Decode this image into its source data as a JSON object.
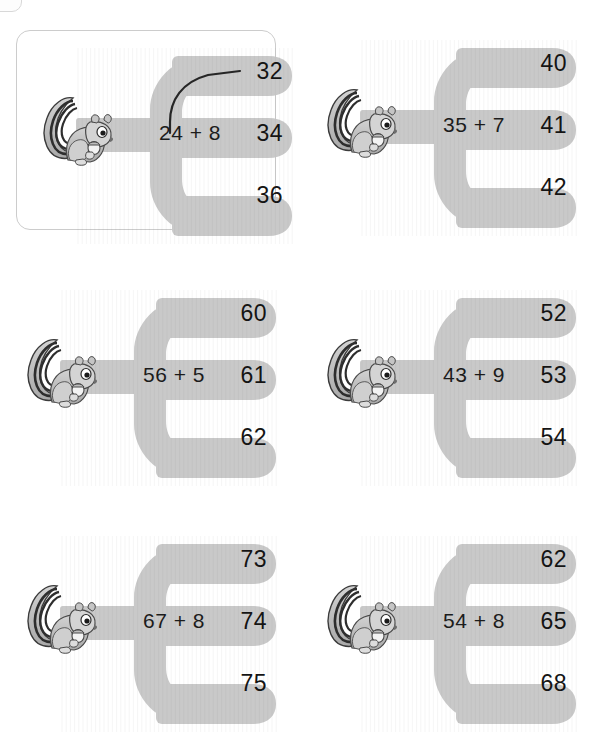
{
  "worksheet": {
    "title": "Addition with regrouping - choose the correct sum",
    "background_color": "#ffffff",
    "piece_color": "#c9c9c9",
    "text_color": "#141414",
    "frame_color": "#cccccc",
    "icon_name": "squirrel-icon"
  },
  "problems": [
    {
      "id": "problem-1",
      "is_example": true,
      "equation": "24 + 8",
      "left_operand": "24",
      "operator": "+",
      "right_operand": "8",
      "options": [
        "32",
        "34",
        "36"
      ],
      "answer": "32",
      "answer_index": 0,
      "answer_drawn": true
    },
    {
      "id": "problem-2",
      "is_example": false,
      "equation": "35 + 7",
      "left_operand": "35",
      "operator": "+",
      "right_operand": "7",
      "options": [
        "40",
        "41",
        "42"
      ],
      "answer": "42",
      "answer_index": 2,
      "answer_drawn": false
    },
    {
      "id": "problem-3",
      "is_example": false,
      "equation": "56 + 5",
      "left_operand": "56",
      "operator": "+",
      "right_operand": "5",
      "options": [
        "60",
        "61",
        "62"
      ],
      "answer": "61",
      "answer_index": 1,
      "answer_drawn": false
    },
    {
      "id": "problem-4",
      "is_example": false,
      "equation": "43 + 9",
      "left_operand": "43",
      "operator": "+",
      "right_operand": "9",
      "options": [
        "52",
        "53",
        "54"
      ],
      "answer": "52",
      "answer_index": 0,
      "answer_drawn": false
    },
    {
      "id": "problem-5",
      "is_example": false,
      "equation": "67 + 8",
      "left_operand": "67",
      "operator": "+",
      "right_operand": "8",
      "options": [
        "73",
        "74",
        "75"
      ],
      "answer": "75",
      "answer_index": 2,
      "answer_drawn": false
    },
    {
      "id": "problem-6",
      "is_example": false,
      "equation": "54 + 8",
      "left_operand": "54",
      "operator": "+",
      "right_operand": "8",
      "options": [
        "62",
        "65",
        "68"
      ],
      "answer": "62",
      "answer_index": 0,
      "answer_drawn": false
    }
  ],
  "layout": {
    "columns": 2,
    "rows": 3,
    "positions": [
      {
        "left": 32,
        "top": 48
      },
      {
        "left": 316,
        "top": 40
      },
      {
        "left": 16,
        "top": 290
      },
      {
        "left": 316,
        "top": 290
      },
      {
        "left": 16,
        "top": 536
      },
      {
        "left": 316,
        "top": 536
      }
    ]
  }
}
